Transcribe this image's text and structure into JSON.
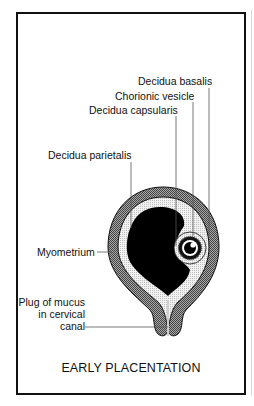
{
  "figure": {
    "title": "EARLY PLACENTATION",
    "labels": {
      "decidua_basalis": "Decidua basalis",
      "chorionic_vesicle": "Chorionic vesicle",
      "decidua_capsularis": "Decidua capsularis",
      "decidua_parietalis": "Decidua parietalis",
      "myometrium": "Myometrium",
      "plug_line1": "Plug of mucus",
      "plug_line2": "in cervical",
      "plug_line3": "canal"
    },
    "colors": {
      "myometrium": "#8a8a8a",
      "decidua": "#dcdcdc",
      "cavity": "#000000",
      "frame": "#111111"
    }
  }
}
